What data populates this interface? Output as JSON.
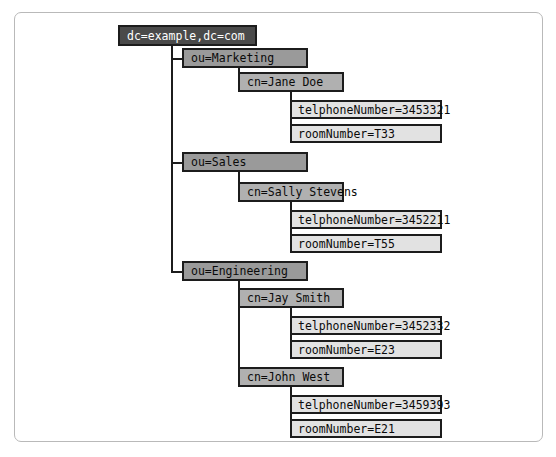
{
  "diagram": {
    "type": "ldap-directory-tree",
    "colors": {
      "root_fill": "#4a4a4a",
      "root_text": "#ffffff",
      "org_fill": "#9a9a9a",
      "person_fill": "#b0b0b0",
      "attribute_fill": "#e2e2e2",
      "border": "#1c1c1c",
      "frame_border": "#b9b9b9",
      "background": "#ffffff"
    },
    "root": {
      "label": "dc=example,dc=com",
      "x": 118,
      "y": 25,
      "w": 139
    },
    "branches": [
      {
        "label": "ou=Marketing",
        "x": 182,
        "y": 48,
        "w": 126,
        "people": [
          {
            "label": "cn=Jane Doe",
            "x": 238,
            "y": 72,
            "w": 106,
            "attributes": [
              {
                "label": "telphoneNumber=3453321",
                "x": 290,
                "y": 100,
                "w": 152
              },
              {
                "label": "roomNumber=T33",
                "x": 290,
                "y": 124,
                "w": 152
              }
            ]
          }
        ]
      },
      {
        "label": "ou=Sales",
        "x": 182,
        "y": 152,
        "w": 126,
        "people": [
          {
            "label": "cn=Sally Stevens",
            "x": 238,
            "y": 182,
            "w": 106,
            "attributes": [
              {
                "label": "telphoneNumber=3452211",
                "x": 290,
                "y": 210,
                "w": 152
              },
              {
                "label": "roomNumber=T55",
                "x": 290,
                "y": 234,
                "w": 152
              }
            ]
          }
        ]
      },
      {
        "label": "ou=Engineering",
        "x": 182,
        "y": 261,
        "w": 126,
        "people": [
          {
            "label": "cn=Jay Smith",
            "x": 238,
            "y": 288,
            "w": 106,
            "attributes": [
              {
                "label": "telphoneNumber=3452332",
                "x": 290,
                "y": 316,
                "w": 152
              },
              {
                "label": "roomNumber=E23",
                "x": 290,
                "y": 340,
                "w": 152
              }
            ]
          },
          {
            "label": "cn=John West",
            "x": 238,
            "y": 367,
            "w": 106,
            "attributes": [
              {
                "label": "telphoneNumber=3459393",
                "x": 290,
                "y": 395,
                "w": 152
              },
              {
                "label": "roomNumber=E21",
                "x": 290,
                "y": 419,
                "w": 152
              }
            ]
          }
        ]
      }
    ]
  }
}
